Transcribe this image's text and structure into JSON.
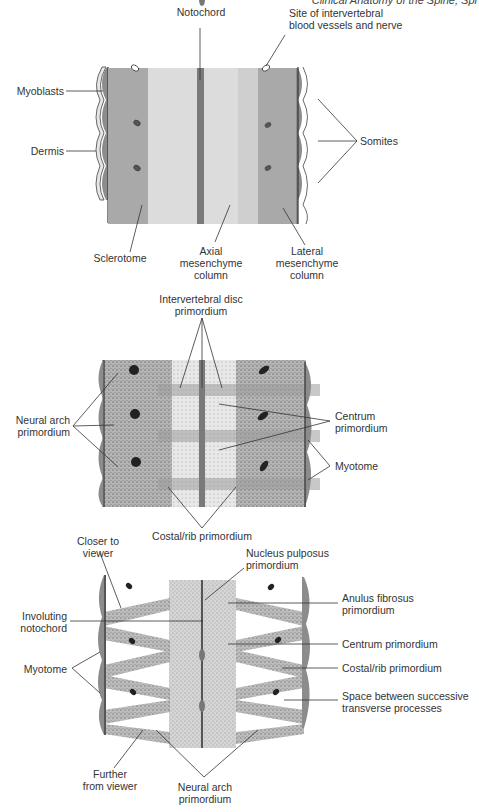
{
  "header": {
    "running_title": "Clinical Anatomy of the Spine, Spi"
  },
  "panels": [
    {
      "id": "panel-a",
      "description": "Somite and mesenchyme column stage",
      "labels": {
        "notochord": "Notochord",
        "intervertebral_site_line1": "Site of intervertebral",
        "intervertebral_site_line2": "blood vessels and nerve",
        "myoblasts": "Myoblasts",
        "dermis": "Dermis",
        "somites": "Somites",
        "sclerotome": "Sclerotome",
        "axial_line1": "Axial",
        "axial_line2": "mesenchyme",
        "axial_line3": "column",
        "lateral_line1": "Lateral",
        "lateral_line2": "mesenchyme",
        "lateral_line3": "column"
      }
    },
    {
      "id": "panel-b",
      "description": "Primordium differentiation stage",
      "labels": {
        "ivd_line1": "Intervertebral disc",
        "ivd_line2": "primordium",
        "neural_arch_line1": "Neural arch",
        "neural_arch_line2": "primordium",
        "centrum_line1": "Centrum",
        "centrum_line2": "primordium",
        "myotome": "Myotome",
        "costal": "Costal/rib primordium"
      }
    },
    {
      "id": "panel-c",
      "description": "Segmental resegmentation stage",
      "labels": {
        "closer_line1": "Closer to",
        "closer_line2": "viewer",
        "nucleus_line1": "Nucleus pulposus",
        "nucleus_line2": "primordium",
        "involuting_line1": "Involuting",
        "involuting_line2": "notochord",
        "anulus_line1": "Anulus fibrosus",
        "anulus_line2": "primordium",
        "centrum": "Centrum primordium",
        "myotome": "Myotome",
        "costal": "Costal/rib primordium",
        "space_line1": "Space between successive",
        "space_line2": "transverse processes",
        "further_line1": "Further",
        "further_line2": "from viewer",
        "neural_arch_line1": "Neural arch",
        "neural_arch_line2": "primordium"
      }
    }
  ],
  "caption": {
    "text": "Figure: Development of the vertebral column from somites"
  },
  "colors": {
    "sclerotome": "#a9a9a9",
    "axial_column": "#dcdcdc",
    "notochord": "#7a7a7a",
    "myotome": "#8c8c8c",
    "dermis": "#e6e6e6",
    "line": "#333333"
  }
}
